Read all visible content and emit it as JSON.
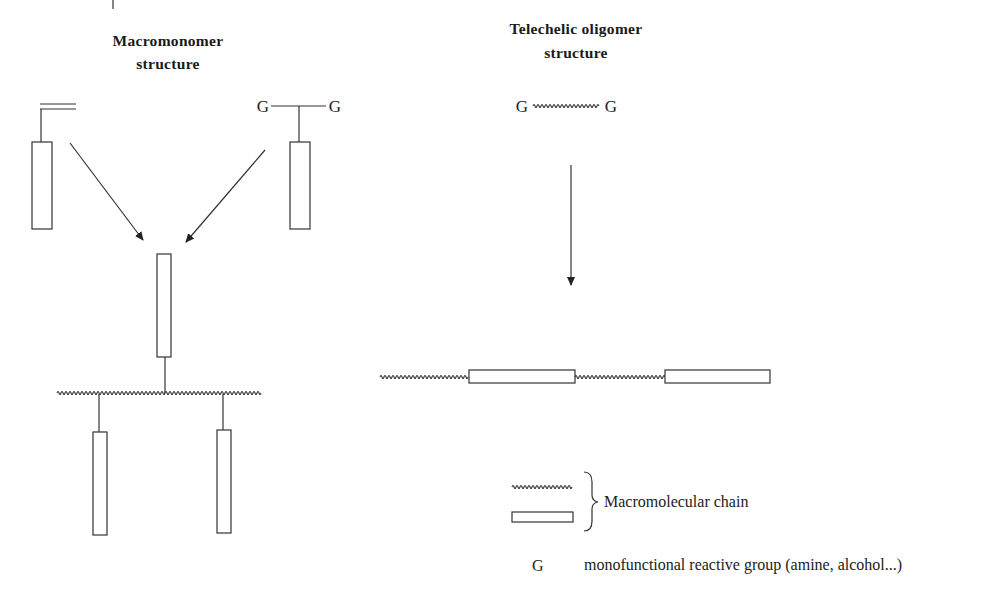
{
  "macromonomer": {
    "title_line1": "Macromonomer",
    "title_line2": "structure",
    "left_group_label": "",
    "right_group_left": "G",
    "right_group_right": "G"
  },
  "telechelic": {
    "title_line1": "Telechelic oligomer",
    "title_line2": "structure",
    "end_left": "G",
    "end_right": "G"
  },
  "legend": {
    "chain_label": "Macromolecular chain",
    "g_symbol": "G",
    "g_description": "monofunctional reactive group (amine, alcohol...)"
  },
  "colors": {
    "line": "#333333",
    "text": "#222222",
    "background": "#ffffff"
  }
}
